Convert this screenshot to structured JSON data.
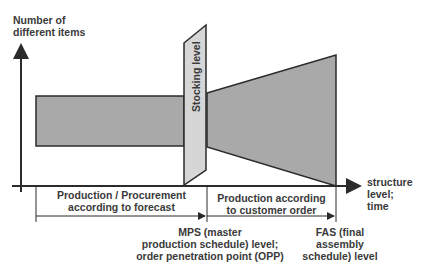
{
  "diagram": {
    "y_axis_label_line1": "Number of",
    "y_axis_label_line2": "different items",
    "x_axis_label_line1": "structure",
    "x_axis_label_line2": "level;",
    "x_axis_label_line3": "time",
    "stocking_label": "Stocking level",
    "phase_forecast_line1": "Production / Procurement",
    "phase_forecast_line2": "according to forecast",
    "phase_order_line1": "Production according",
    "phase_order_line2": "to customer order",
    "mps_line1": "MPS (master",
    "mps_line2": "production schedule) level;",
    "mps_line3": "order penetration point (OPP)",
    "fas_line1": "FAS (final",
    "fas_line2": "assembly",
    "fas_line3": "schedule) level",
    "colors": {
      "dark_fill": "#a9a9a9",
      "light_fill": "#d6d6d6",
      "stroke": "#2b2b2b"
    }
  }
}
